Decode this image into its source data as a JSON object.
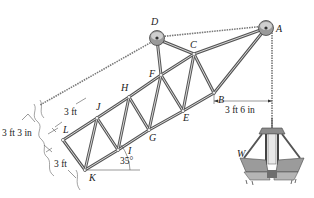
{
  "figure": {
    "type": "crane truss boom with clamshell bucket",
    "nodes": [
      {
        "id": "A",
        "label": "A",
        "x": 266,
        "y": 28,
        "lx": 276,
        "ly": 32
      },
      {
        "id": "B",
        "label": "B",
        "x": 214,
        "y": 93,
        "lx": 218,
        "ly": 103
      },
      {
        "id": "C",
        "label": "C",
        "x": 194,
        "y": 54,
        "lx": 190,
        "ly": 48
      },
      {
        "id": "D",
        "label": "D",
        "x": 157,
        "y": 39,
        "lx": 151,
        "ly": 25
      },
      {
        "id": "E",
        "label": "E",
        "x": 183,
        "y": 111,
        "lx": 183,
        "ly": 121
      },
      {
        "id": "F",
        "label": "F",
        "x": 161,
        "y": 75,
        "lx": 149,
        "ly": 77
      },
      {
        "id": "G",
        "label": "G",
        "x": 149,
        "y": 130,
        "lx": 149,
        "ly": 141
      },
      {
        "id": "H",
        "label": "H",
        "x": 129,
        "y": 97,
        "lx": 121,
        "ly": 91
      },
      {
        "id": "I",
        "label": "I",
        "x": 118,
        "y": 150,
        "lx": 128,
        "ly": 154
      },
      {
        "id": "J",
        "label": "J",
        "x": 97,
        "y": 118,
        "lx": 96,
        "ly": 110
      },
      {
        "id": "K",
        "label": "K",
        "x": 85,
        "y": 170,
        "lx": 89,
        "ly": 181
      },
      {
        "id": "L",
        "label": "L",
        "x": 63,
        "y": 140,
        "lx": 63,
        "ly": 133
      },
      {
        "id": "W",
        "label": "W",
        "x": 238,
        "y": 155,
        "lx": 237,
        "ly": 157
      }
    ],
    "members": [
      [
        "K",
        "L"
      ],
      [
        "L",
        "J"
      ],
      [
        "J",
        "H"
      ],
      [
        "H",
        "F"
      ],
      [
        "F",
        "C"
      ],
      [
        "C",
        "A"
      ],
      [
        "K",
        "I"
      ],
      [
        "I",
        "G"
      ],
      [
        "G",
        "E"
      ],
      [
        "E",
        "B"
      ],
      [
        "B",
        "A"
      ],
      [
        "K",
        "J"
      ],
      [
        "J",
        "I"
      ],
      [
        "I",
        "H"
      ],
      [
        "H",
        "G"
      ],
      [
        "G",
        "F"
      ],
      [
        "F",
        "E"
      ],
      [
        "E",
        "C"
      ],
      [
        "C",
        "B"
      ],
      [
        "F",
        "D"
      ],
      [
        "D",
        "C"
      ]
    ],
    "dimensions": {
      "top_panel": "3 ft",
      "depth": "3 ft 3 in",
      "bottom_panel": "3 ft",
      "horizontal_offset": "3 ft 6 in",
      "angle": "35°"
    }
  }
}
